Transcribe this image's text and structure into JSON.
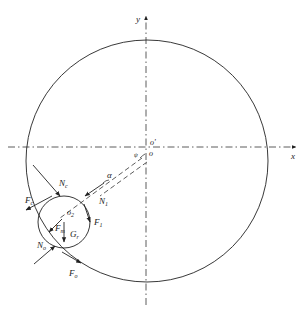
{
  "diagram": {
    "axes": {
      "x_label": "x",
      "y_label": "y"
    },
    "origins": {
      "o_prime": "o'",
      "o": "o",
      "o2": "o",
      "o2_sub": "2"
    },
    "angle_label": "α",
    "small_angle_label": "ψ",
    "forces": {
      "N_c": {
        "main": "N",
        "sub": "c"
      },
      "F_c": {
        "main": "F",
        "sub": "c"
      },
      "N_1": {
        "main": "N",
        "sub": "1"
      },
      "F_1": {
        "main": "F",
        "sub": "1"
      },
      "F_m": {
        "main": "F",
        "sub": "m"
      },
      "G_r": {
        "main": "G",
        "sub": "r"
      },
      "N_o": {
        "main": "N",
        "sub": "o"
      },
      "F_o": {
        "main": "F",
        "sub": "o"
      }
    },
    "colors": {
      "stroke": "#222222",
      "background": "#ffffff"
    }
  }
}
